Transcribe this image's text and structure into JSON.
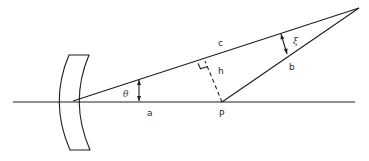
{
  "diagram": {
    "type": "optics-geometry",
    "labels": {
      "c": "c",
      "xi": "ξ",
      "theta": "θ",
      "a": "a",
      "h": "h",
      "b": "b",
      "P": "P"
    },
    "colors": {
      "line": "#1e1e1e",
      "background": "#ffffff"
    }
  }
}
